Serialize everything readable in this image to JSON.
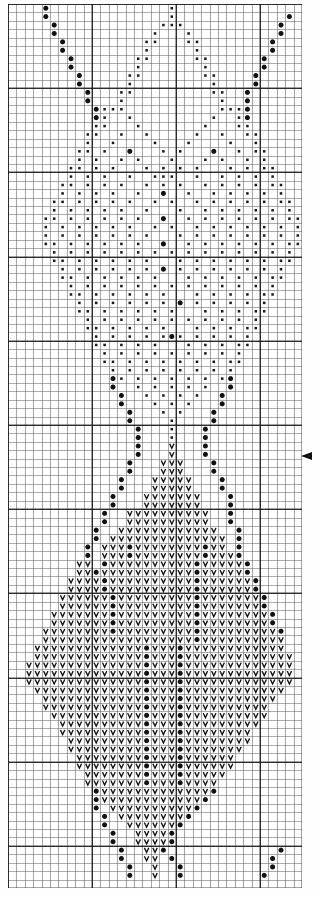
{
  "document": {
    "type": "cross-stitch-pattern-chart",
    "title": "Cross Stitch Pattern Chart",
    "grid": {
      "columns": 35,
      "rows": 105,
      "cell_size_px": 8.4,
      "minor_line_color": "#5a5a5a",
      "major_line_color": "#111111",
      "major_line_every": 10,
      "background_color": "#ffffff"
    },
    "markers": [
      {
        "name": "center-row-marker",
        "edge": "right",
        "row": 53,
        "glyph": "triangle-left",
        "color": "#111111"
      }
    ],
    "legend": {
      "symbols": [
        {
          "key": "L",
          "name": "large-dot",
          "glyph": "●",
          "color": "#111111",
          "description": "large filled dot"
        },
        {
          "key": "s",
          "name": "small-dot",
          "glyph": "▪",
          "color": "#1a1a1a",
          "description": "small filled square dot"
        },
        {
          "key": "V",
          "name": "v-stitch",
          "glyph": "V",
          "color": "#111111",
          "description": "V symbol"
        }
      ]
    }
  },
  "chart_data": {
    "type": "heatmap",
    "title": "Cross Stitch Pattern Chart",
    "xlabel": "",
    "ylabel": "",
    "grid_on": true,
    "legend_position": "none",
    "columns": 35,
    "rows": 105,
    "symbol_key": {
      "0": "empty",
      "L": "large-dot",
      "s": "small-dot",
      "V": "v-stitch"
    },
    "cells": [
      "....L..............s...............",
      "....L..............s.............L.",
      ".....L............sss...........L..",
      ".....L...........s...s..........L..",
      "......L.........ss...ss........L...",
      "......L.........s.....s........L...",
      ".......L.......ss.....ss......L....",
      ".......L.......s.......s......L....",
      "........L.....ss.......ss....L.....",
      "........L.....s.........s....L.....",
      ".........L...ss.........ss..L......",
      ".........L...s...........s..L......",
      "..........Lsss...........sssL......",
      "..........Ls..s.........s..sL......",
      "..........ss...s.......s...ss......",
      ".........ss..s..s.....s..s..ss.....",
      ".........s..s....s...s....s..s.....",
      "........ss.s..L...s.s...L..s.ss....",
      "........s.s..s.s...s...s.s..s.s....",
      ".......ss.s.s...s.s.s.s...s.s.ss...",
      ".......s.s.s..s..sss..s..s.s.s.s...",
      "......ss.s.s.s..s.s.s..s.s.s.s.ss..",
      "......s.s.s.s..s..L..s..s.s.s.s.s..",
      ".....ss.s.s.s.s..s.s..s.s.s.s.s.ss.",
      ".....s.s.s.s.s..s...s..s.s.s.s.s.s.",
      "....ss.s.s.s.s.s..L..s.s.s.s.s.s.ss",
      "....s.s.s.s.s.s..s.s..s.s.s.s.s.s.s",
      "....s.s.s.s.s.s.s...s.s.s.s.s.s.s.s",
      "....ss.s.s.s.s.s..L..s.s.s.s.s.s.ss",
      ".....s.s.s.s.s.s.s.s.s.s.s.s.s.s.s.",
      ".....ss.s.s.s.s.s...s.s.s.s.s.s.ss.",
      "......s.s.s.s.s.s.L.s.s.s.s.s.s.s..",
      "......ss.s.s.s.s.s...s.s.s.s.s.ss..",
      ".......s.s.s.s.s.s.s.s.s.s.s.s.s...",
      ".......ss.s.s.s.s.s...s.s.s.s.ss...",
      "........s.s.s.s.s.s.L.s.s.s.s.s....",
      "........ss.s.s.s.s.s...s.s.s.ss....",
      ".........s.s.s.s.s.s.s.s.s.s.s.....",
      ".........ss.s.s.s.s...s.s.s.ss.....",
      "..........s.s.s.s.sLs.s.s.s.s......",
      "..........ss.s.s.s...s.s.s.ss......",
      "...........s.s.s.s.s.s.s.s.s.......",
      "...........ss.s.s.s.s.s.s.ss.......",
      "............s.s.s.s.s.s.s.s........",
      "............Ls.s.s.s.s.s.sL........",
      "............L..s.s.s.s.s..L........",
      ".............L..s.s.s.s..L.........",
      ".............L...s.s.s...L.........",
      "..............L...s.s...L..........",
      "..............L....s....L..........",
      "...............L...s...L...........",
      "...............L...s...L...........",
      "...............L...V...L...........",
      "...............L...V...L...........",
      "..............L...VVV...L..........",
      "..............L...VVV...L..........",
      ".............L...VVVVV...L.........",
      ".............L...VVVVV...L.........",
      "............L...VVVVVVV...L........",
      "............L...VVVVVVV...L........",
      "...........L..VVVVVVVVVV..L........",
      "...........L..VVVVVVVVVV..L........",
      "..........L..VVVVVVVVVVVV..L.......",
      "..........L.VVVVVVVVVVVVVV.L.......",
      ".........L.VVVLVVVVVVVVLVV.L.......",
      ".........L.VVVLVVVVVVVVLVVVL.......",
      "........VV.LVVVVVVVVVVLVVVVVL......",
      "........VVLVVVVVVVVVVVLVVVVVL......",
      ".......VVVVLVVVVVVVVVVLVVVVVVL.....",
      ".......VVVVLVVVVVVVVVVLVVVVVVL.....",
      "......VVVVVVLVVVVVVVVVLVVVVVVVL....",
      "......VVVVVVLVVVVVVVVVLVVVVVVVL....",
      ".....VVVVVVVLVVVVVVVVVLVVVVVVVVL...",
      ".....VVVVVVVLVVVVVVVVVLVVVVVVVVL...",
      "....VVVVVVVVLVVVVVVVVVLVVVVVVVVVL..",
      "....VVVVVVVVVVVVVVVVVVLVVVVVVVVVV..",
      "...VVVVVVVVVVVVVLVVVLVVVVVVVVVVVV..",
      "...VVVVVVVVVVVVVLVVVLVVVVVVVVVVVVV.",
      "..VVVVVVVVVVVVVVLVVVLVVVVVVVVVVVVV.",
      "..VVVVVVVVVVVVVVLVVVLVVVVVVVVVVVVV.",
      "..VVVVVVVVVVVVVVLVVVLVVVVVVVVVVVVV.",
      "...VVVVVVVVVVVVVLVVVLVVVVVVVVVVVV..",
      "....VVVVVVVVVVVVLVVVLVVVVVVVVVVV...",
      "....VVVVVVVVVVVVLVVVLVVVVVVVVVV....",
      ".....VVVVVVVVVVVLVVVLVVVVVVVVVV....",
      "......VVVVVVVVVVLVVVLVVVVVVVVV.....",
      "......VVVVVVVVVVLVVVLVVVVVVVV......",
      ".......VVVVVVVVVLVVVLVVVVVVVV......",
      ".......VVVVVVVVVLVVVLVVVVVVV.......",
      "........VVVVVVVVLVVVLVVVVVV........",
      "........VVVVVVVVLVVVLVVVVVV........",
      ".........VVVVVVVLVVVLVVVVV.........",
      ".........VVVVVVVLVVVLVVVV..........",
      "..........LVVVVVVVVVVVVVL..........",
      "..........LVVVVVVVVVVVVL...........",
      "..........L.VVVVVVVVVVL............",
      "...........L.VVVVVVVVL.............",
      "...........L..VVVVVVL..............",
      "............L..VVVVL...............",
      "............L..VVVVL...............",
      ".............L..VVL.............L..",
      ".............L..VV.L...........L...",
      "..............L..V..L..........L...",
      "..............L..V..L.........L...."
    ]
  }
}
